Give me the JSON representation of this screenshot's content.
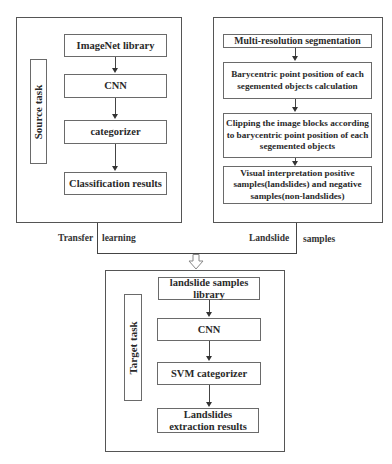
{
  "source_panel": {
    "side_label": "Source task",
    "steps": [
      "ImageNet library",
      "CNN",
      "categorizer",
      "Classification results"
    ]
  },
  "segmentation_panel": {
    "steps": [
      "Multi-resolution segmentation",
      "Barycentric point position of each segemented objects calculation",
      "Clipping the image blocks according to barycentric point position of each segemented objects",
      "Visual interpretation positive samples(landslides) and negative samples(non-landslides)"
    ]
  },
  "connectors": {
    "left_label_a": "Transfer",
    "left_label_b": "learning",
    "right_label_a": "Landslide",
    "right_label_b": "samples"
  },
  "target_panel": {
    "side_label": "Target task",
    "steps": [
      "landslide samples library",
      "CNN",
      "SVM categorizer",
      "Landslides extraction results"
    ]
  },
  "colors": {
    "line": "#444444",
    "border": "#6a6a6a",
    "text": "#2a2a2a"
  }
}
